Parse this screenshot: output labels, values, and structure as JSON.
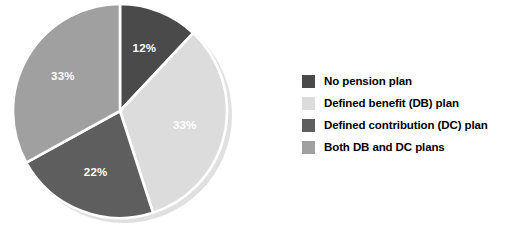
{
  "chart_data": {
    "type": "pie",
    "title": "",
    "subtitle": "",
    "xlabel": "",
    "ylabel": "",
    "grid": false,
    "legend_position": "right",
    "start_angle_deg": 0,
    "direction": "clockwise",
    "categories": [
      "No pension plan",
      "Defined benefit (DB) plan",
      "Defined contribution (DC) plan",
      "Both DB and DC plans"
    ],
    "values": [
      12,
      33,
      22,
      33
    ],
    "labels": [
      "12%",
      "33%",
      "22%",
      "33%"
    ],
    "colors": [
      "#4a4a4a",
      "#dcdcdc",
      "#5e5e5e",
      "#a0a0a0"
    ],
    "slices": [
      {
        "name": "No pension plan",
        "value": 12,
        "label": "12%",
        "color": "#4a4a4a",
        "label_color": "#ffffff"
      },
      {
        "name": "Defined benefit (DB) plan",
        "value": 33,
        "label": "33%",
        "color": "#dcdcdc",
        "label_color": "#ffffff"
      },
      {
        "name": "Defined contribution (DC) plan",
        "value": 22,
        "label": "22%",
        "color": "#5e5e5e",
        "label_color": "#ffffff"
      },
      {
        "name": "Both DB and DC plans",
        "value": 33,
        "label": "33%",
        "color": "#a0a0a0",
        "label_color": "#ffffff"
      }
    ]
  },
  "legend": {
    "items": [
      {
        "label": "No pension plan",
        "color": "#4a4a4a"
      },
      {
        "label": "Defined benefit (DB) plan",
        "color": "#dcdcdc"
      },
      {
        "label": "Defined contribution (DC) plan",
        "color": "#5e5e5e"
      },
      {
        "label": "Both DB and DC plans",
        "color": "#a0a0a0"
      }
    ]
  },
  "style": {
    "background": "#ffffff",
    "separator_color": "#ffffff",
    "shadow_color": "#c8c8c8"
  }
}
